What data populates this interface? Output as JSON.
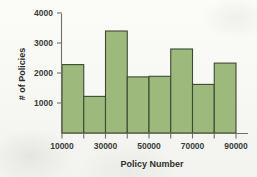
{
  "chart_data": {
    "type": "bar",
    "title": "",
    "subtitle": "",
    "xlabel": "Policy Number",
    "ylabel": "# of Policies",
    "categories": [
      "10000-20000",
      "20000-30000",
      "30000-40000",
      "40000-50000",
      "50000-60000",
      "60000-70000",
      "70000-80000",
      "80000-90000"
    ],
    "bin_edges": [
      10000,
      20000,
      30000,
      40000,
      50000,
      60000,
      70000,
      80000,
      90000
    ],
    "values": [
      2280,
      1220,
      3400,
      1870,
      1890,
      2800,
      1620,
      2330
    ],
    "x_tick_labels": [
      "10000",
      "30000",
      "50000",
      "70000",
      "90000"
    ],
    "x_tick_values": [
      10000,
      30000,
      50000,
      70000,
      90000
    ],
    "y_tick_labels": [
      "1000",
      "2000",
      "3000",
      "4000"
    ],
    "y_tick_values": [
      1000,
      2000,
      3000,
      4000
    ],
    "xlim": [
      10000,
      90000
    ],
    "ylim": [
      0,
      4400
    ],
    "grid": false,
    "legend": "none",
    "bar_fill_color": "#9eb97c",
    "bar_edge_color": "#3c4a33",
    "axis_color": "#6f706c",
    "text_color": "#3b3b3b",
    "background_color": "#f7f8f4"
  },
  "figure": {
    "y_axis_label": "# of Policies",
    "x_axis_label": "Policy Number"
  }
}
